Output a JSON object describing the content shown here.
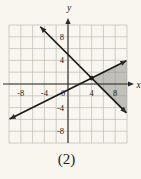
{
  "figure": {
    "caption": "(2)"
  },
  "chart_data": {
    "type": "line",
    "title": "",
    "axes": {
      "xlabel": "x",
      "ylabel": "y",
      "xlim": [
        -10,
        10
      ],
      "ylim": [
        -10,
        10
      ],
      "grid_step": 2,
      "grid_on": true,
      "x_ticks": [
        {
          "value": -8,
          "label": "-8"
        },
        {
          "value": -4,
          "label": "-4"
        },
        {
          "value": 4,
          "label": "4"
        },
        {
          "value": 8,
          "label": "8"
        }
      ],
      "y_ticks": [
        {
          "value": 8,
          "label": "8"
        },
        {
          "value": 4,
          "label": "4"
        },
        {
          "value": -4,
          "label": "-4"
        },
        {
          "value": -8,
          "label": "-8"
        }
      ],
      "origin_label": "0"
    },
    "series": [
      {
        "name": "line-descending",
        "equation": "y = -x + 5",
        "slope": -1,
        "y_intercept": 5,
        "endpoints": [
          [
            -4.7,
            9.7
          ],
          [
            9.9,
            -4.9
          ]
        ],
        "arrowheads": "both"
      },
      {
        "name": "line-ascending",
        "equation": "y = x/2 - 1",
        "slope": 0.5,
        "y_intercept": -1,
        "endpoints": [
          [
            -9.9,
            -5.95
          ],
          [
            9.9,
            3.95
          ]
        ],
        "arrowheads": "both"
      }
    ],
    "points": [
      {
        "name": "intersection",
        "x": 4,
        "y": 1,
        "style": "filled-dot"
      }
    ],
    "shaded_region": {
      "vertices": [
        [
          4,
          1
        ],
        [
          10,
          4
        ],
        [
          10,
          -5
        ]
      ],
      "note": "wedge between the two lines, right of intersection, to grid edge"
    },
    "colors": {
      "background": "#f8f6ef",
      "grid": "#c3c2ba",
      "axis": "#2a2a28",
      "line": "#1b1b1a",
      "shade": "#8a8981",
      "label": "#1d1d1c"
    }
  }
}
